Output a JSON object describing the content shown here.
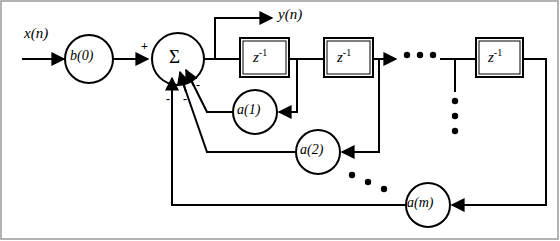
{
  "diagram": {
    "background": "#ffffff",
    "stroke": "#000000",
    "border_color": "#9a9a9a",
    "width": 560,
    "height": 241,
    "input": {
      "label": "x(n)",
      "name": "input-signal"
    },
    "output": {
      "label": "y(n)",
      "name": "output-signal"
    },
    "gain_forward": {
      "label": "b(0)",
      "name": "gain-b0"
    },
    "summation": {
      "label": "Σ",
      "name": "summation-node"
    },
    "signs": {
      "plus": "+",
      "minus": "-",
      "plus_count": 1,
      "minus_count": 3
    },
    "delay_blocks": [
      {
        "label": "z",
        "exponent": "-1",
        "name": "delay-1"
      },
      {
        "label": "z",
        "exponent": "-1",
        "name": "delay-2"
      },
      {
        "label": "z",
        "exponent": "-1",
        "name": "delay-m"
      }
    ],
    "feedback_gains": [
      {
        "label": "a(1)",
        "name": "gain-a1"
      },
      {
        "label": "a(2)",
        "name": "gain-a2"
      },
      {
        "label": "a(m)",
        "name": "gain-am"
      }
    ],
    "ellipses": [
      {
        "name": "horizontal-ellipsis-delay-chain",
        "dots": 3,
        "orientation": "horizontal"
      },
      {
        "name": "vertical-ellipsis-taps",
        "dots": 3,
        "orientation": "vertical"
      },
      {
        "name": "diagonal-ellipsis-feedback",
        "dots": 3,
        "orientation": "diagonal"
      }
    ]
  }
}
